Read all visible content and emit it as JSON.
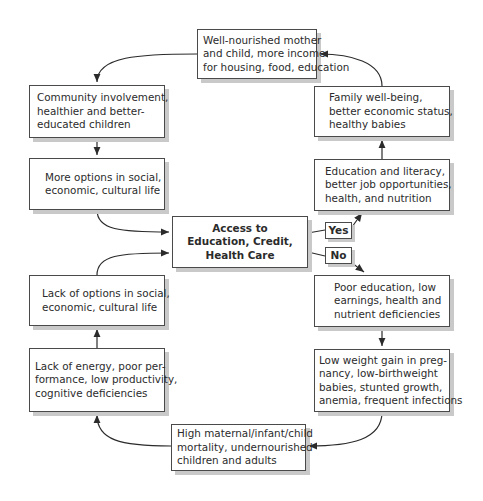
{
  "diagram": {
    "type": "cycle-flowchart",
    "nodes": {
      "top": {
        "lines": [
          "Well-nourished mother",
          "and child, more income",
          "for housing, food, education"
        ]
      },
      "left1": {
        "lines": [
          "Community involvement,",
          "healthier and better-",
          "educated children"
        ]
      },
      "left2": {
        "lines": [
          "More options in social,",
          "economic, cultural life"
        ]
      },
      "center": {
        "lines": [
          "Access to",
          "Education, Credit,",
          "Health Care"
        ]
      },
      "right1": {
        "lines": [
          "Family well-being,",
          "better economic status,",
          "healthy babies"
        ]
      },
      "right2": {
        "lines": [
          "Education and literacy,",
          "better job opportunities,",
          "health, and nutrition"
        ]
      },
      "right3": {
        "lines": [
          "Poor education, low",
          "earnings, health and",
          "nutrient deficiencies"
        ]
      },
      "right4": {
        "lines": [
          "Low weight gain in preg-",
          "nancy, low-birthweight",
          "babies, stunted growth,",
          "anemia, frequent infections"
        ]
      },
      "bottom": {
        "lines": [
          "High maternal/infant/child",
          "mortality, undernourished",
          "children and adults"
        ]
      },
      "left4": {
        "lines": [
          "Lack of energy, poor per-",
          "formance, low productivity,",
          "cognitive deficiencies"
        ]
      },
      "left3": {
        "lines": [
          "Lack of options in social,",
          "economic, cultural life"
        ]
      }
    },
    "branches": {
      "yes": "Yes",
      "no": "No"
    },
    "colors": {
      "border": "#4a4a4a",
      "shadow": "#c9c9c9",
      "arrow": "#2b2b2b",
      "background": "#ffffff"
    }
  }
}
